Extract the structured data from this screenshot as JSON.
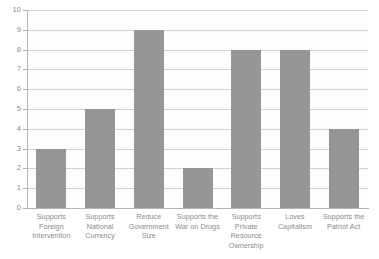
{
  "chart_data": {
    "type": "bar",
    "title": "",
    "subtitle": "",
    "xlabel": "",
    "ylabel": "",
    "ylim": [
      0,
      10
    ],
    "ytick_step": 1,
    "yticks": [
      "10",
      "9",
      "8",
      "7",
      "6",
      "5",
      "4",
      "3",
      "2",
      "1",
      "0"
    ],
    "grid": true,
    "legend": false,
    "legend_position": "none",
    "orientation": "vertical",
    "categories": [
      "Supports Foreign Intervention",
      "Supports National Currency",
      "Reduce Government Size",
      "Supports the War on Drugs",
      "Supports Private Resource Ownership",
      "Loves Capitalism",
      "Supports the Patriot Act"
    ],
    "values": [
      3,
      5,
      9,
      2,
      8,
      8,
      4
    ],
    "series": [
      {
        "name": "",
        "values": [
          3,
          5,
          9,
          2,
          8,
          8,
          4
        ]
      }
    ],
    "colors": {
      "bar": "#969696",
      "plot_background": "#fdfdfd",
      "gridline": "#d2d2d2",
      "axis_line": "#b5b5b5",
      "tick_label": "#8a8a8a",
      "page_background": "#ffffff"
    }
  }
}
